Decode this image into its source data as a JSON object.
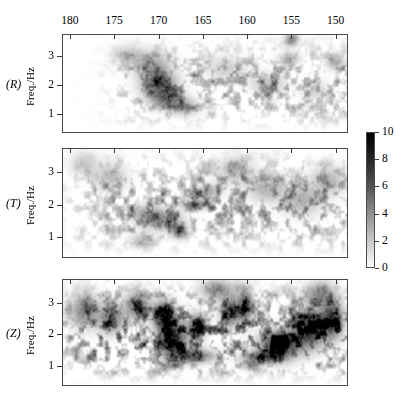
{
  "figure": {
    "type": "spectrogram-triptych",
    "background": "#ffffff",
    "width": 410,
    "height": 404
  },
  "axis": {
    "x": {
      "label": "",
      "ticklabels": [
        "180",
        "175",
        "170",
        "165",
        "160",
        "155",
        "150"
      ],
      "tickvalues": [
        180,
        175,
        170,
        165,
        160,
        155,
        150
      ],
      "range": [
        180.9,
        148.6
      ],
      "direction": "decreasing",
      "position": "top"
    },
    "y": {
      "label": "Freq./Hz",
      "ticklabels": [
        "3",
        "2",
        "1"
      ],
      "tickvalues": [
        3,
        2,
        1
      ],
      "range": [
        0.35,
        3.75
      ],
      "direction": "increasing-upward"
    }
  },
  "panels": [
    {
      "tag": "(R)",
      "ylabel": "Freq./Hz",
      "component": "radial",
      "intensity": 0.52,
      "seed": 1731,
      "blobs": [
        {
          "x": 170.0,
          "y": 1.95,
          "sx": 1.9,
          "sy": 0.42,
          "a": 0.95
        },
        {
          "x": 169.2,
          "y": 1.55,
          "sx": 1.6,
          "sy": 0.3,
          "a": 0.88
        },
        {
          "x": 170.4,
          "y": 2.35,
          "sx": 1.7,
          "sy": 0.36,
          "a": 0.72
        },
        {
          "x": 171.0,
          "y": 2.85,
          "sx": 2.1,
          "sy": 0.38,
          "a": 0.52
        },
        {
          "x": 167.2,
          "y": 1.3,
          "sx": 1.5,
          "sy": 0.28,
          "a": 0.6
        },
        {
          "x": 155.1,
          "y": 3.62,
          "sx": 0.7,
          "sy": 0.22,
          "a": 0.92
        },
        {
          "x": 155.4,
          "y": 2.95,
          "sx": 1.1,
          "sy": 0.22,
          "a": 0.55
        },
        {
          "x": 150.2,
          "y": 2.85,
          "sx": 1.0,
          "sy": 0.25,
          "a": 0.62
        },
        {
          "x": 157.8,
          "y": 2.1,
          "sx": 1.8,
          "sy": 0.35,
          "a": 0.46
        },
        {
          "x": 162.5,
          "y": 2.6,
          "sx": 2.2,
          "sy": 0.4,
          "a": 0.34
        },
        {
          "x": 173.5,
          "y": 3.05,
          "sx": 1.6,
          "sy": 0.35,
          "a": 0.38
        },
        {
          "x": 152.5,
          "y": 1.85,
          "sx": 1.5,
          "sy": 0.35,
          "a": 0.3
        }
      ]
    },
    {
      "tag": "(T)",
      "ylabel": "Freq./Hz",
      "component": "transverse",
      "intensity": 0.62,
      "seed": 4409,
      "blobs": [
        {
          "x": 167.8,
          "y": 1.22,
          "sx": 0.8,
          "sy": 0.2,
          "a": 0.98
        },
        {
          "x": 166.0,
          "y": 2.05,
          "sx": 1.4,
          "sy": 0.16,
          "a": 0.8
        },
        {
          "x": 169.5,
          "y": 1.55,
          "sx": 2.0,
          "sy": 0.3,
          "a": 0.62
        },
        {
          "x": 171.5,
          "y": 1.75,
          "sx": 1.7,
          "sy": 0.28,
          "a": 0.58
        },
        {
          "x": 164.5,
          "y": 2.45,
          "sx": 1.3,
          "sy": 0.22,
          "a": 0.52
        },
        {
          "x": 158.0,
          "y": 2.55,
          "sx": 2.0,
          "sy": 0.38,
          "a": 0.46
        },
        {
          "x": 154.0,
          "y": 2.2,
          "sx": 2.2,
          "sy": 0.45,
          "a": 0.48
        },
        {
          "x": 151.0,
          "y": 2.8,
          "sx": 1.8,
          "sy": 0.42,
          "a": 0.44
        },
        {
          "x": 175.5,
          "y": 2.9,
          "sx": 1.6,
          "sy": 0.4,
          "a": 0.4
        },
        {
          "x": 178.5,
          "y": 3.3,
          "sx": 1.4,
          "sy": 0.35,
          "a": 0.34
        },
        {
          "x": 161.5,
          "y": 3.1,
          "sx": 2.0,
          "sy": 0.4,
          "a": 0.4
        },
        {
          "x": 172.0,
          "y": 0.95,
          "sx": 1.4,
          "sy": 0.22,
          "a": 0.36
        }
      ]
    },
    {
      "tag": "(Z)",
      "ylabel": "Freq./Hz",
      "component": "vertical",
      "intensity": 0.95,
      "seed": 8821,
      "blobs": [
        {
          "x": 168.6,
          "y": 1.95,
          "sx": 1.5,
          "sy": 0.55,
          "a": 1.0
        },
        {
          "x": 169.6,
          "y": 2.65,
          "sx": 1.1,
          "sy": 0.4,
          "a": 0.95
        },
        {
          "x": 156.5,
          "y": 1.7,
          "sx": 2.0,
          "sy": 0.42,
          "a": 1.0
        },
        {
          "x": 153.2,
          "y": 2.2,
          "sx": 1.7,
          "sy": 0.55,
          "a": 0.96
        },
        {
          "x": 150.6,
          "y": 2.5,
          "sx": 1.2,
          "sy": 0.55,
          "a": 0.88
        },
        {
          "x": 165.8,
          "y": 2.3,
          "sx": 1.0,
          "sy": 0.35,
          "a": 0.74
        },
        {
          "x": 162.0,
          "y": 2.75,
          "sx": 1.1,
          "sy": 0.45,
          "a": 0.7
        },
        {
          "x": 160.3,
          "y": 2.95,
          "sx": 0.8,
          "sy": 0.5,
          "a": 0.72
        },
        {
          "x": 172.5,
          "y": 2.95,
          "sx": 1.3,
          "sy": 0.4,
          "a": 0.66
        },
        {
          "x": 175.5,
          "y": 2.55,
          "sx": 1.4,
          "sy": 0.45,
          "a": 0.58
        },
        {
          "x": 178.5,
          "y": 2.8,
          "sx": 1.5,
          "sy": 0.5,
          "a": 0.52
        },
        {
          "x": 166.5,
          "y": 1.35,
          "sx": 2.4,
          "sy": 0.22,
          "a": 0.7
        },
        {
          "x": 158.5,
          "y": 1.3,
          "sx": 2.0,
          "sy": 0.2,
          "a": 0.62
        },
        {
          "x": 152.0,
          "y": 3.3,
          "sx": 1.6,
          "sy": 0.35,
          "a": 0.5
        },
        {
          "x": 163.5,
          "y": 3.45,
          "sx": 1.8,
          "sy": 0.3,
          "a": 0.44
        }
      ]
    }
  ],
  "colorbar": {
    "orientation": "vertical",
    "min": 0,
    "max": 10,
    "ticklabels": [
      "10",
      "8",
      "6",
      "4",
      "2",
      "0"
    ],
    "tickvalues": [
      10,
      8,
      6,
      4,
      2,
      0
    ],
    "colormap": "grayscale-reversed",
    "color_high": "#000000",
    "color_low": "#ffffff"
  },
  "chart_data": {
    "type": "heatmap",
    "title": "",
    "subtitle": "",
    "xlabel": "",
    "ylabel": "Freq./Hz",
    "panel_labels": [
      "(R)",
      "(T)",
      "(Z)"
    ],
    "x_ticklabels": [
      "180",
      "175",
      "170",
      "165",
      "160",
      "155",
      "150"
    ],
    "y_ticklabels": [
      "3",
      "2",
      "1"
    ],
    "xlim": [
      180.9,
      148.6
    ],
    "ylim": [
      0.35,
      3.75
    ],
    "colorbar_ticklabels": [
      "0",
      "2",
      "4",
      "6",
      "8",
      "10"
    ],
    "colorbar_range": [
      0,
      10
    ],
    "grid": false,
    "legend_position": "right",
    "series": [
      {
        "name": "(R)",
        "peak_amplitude": 6.2,
        "peak_x": 170.0,
        "peak_y": 1.95
      },
      {
        "name": "(T)",
        "peak_amplitude": 7.4,
        "peak_x": 167.8,
        "peak_y": 1.22
      },
      {
        "name": "(Z)",
        "peak_amplitude": 10.0,
        "peak_x": 168.6,
        "peak_y": 1.95
      }
    ]
  },
  "geometry": {
    "plot_left": 62,
    "plot_right": 348,
    "panel_tops": [
      34,
      148,
      279
    ],
    "panel_bottoms": [
      133,
      258,
      386
    ],
    "colorbar": {
      "left": 366,
      "top": 132,
      "width": 9,
      "height": 136
    }
  }
}
